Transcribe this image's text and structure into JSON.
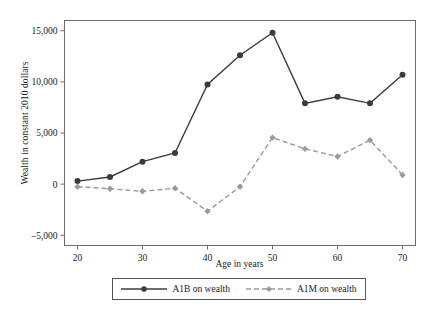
{
  "chart_data": {
    "type": "line",
    "title": "",
    "xlabel": "Age in years",
    "ylabel": "Wealth in constant 2010 dollars",
    "x": [
      20,
      25,
      30,
      35,
      40,
      45,
      50,
      55,
      60,
      65,
      70
    ],
    "xlim": [
      18,
      72
    ],
    "ylim": [
      -6000,
      16000
    ],
    "xticks": [
      20,
      30,
      40,
      50,
      60,
      70
    ],
    "xtick_labels": [
      "20",
      "30",
      "40",
      "50",
      "60",
      "70"
    ],
    "yticks": [
      -5000,
      0,
      5000,
      10000,
      15000
    ],
    "ytick_labels": [
      "–5,000",
      "0",
      "5,000",
      "10,000",
      "15,000"
    ],
    "grid": false,
    "legend_position": "bottom",
    "series": [
      {
        "name": "A1B on wealth",
        "style": "solid",
        "color": "#3b3b3f",
        "marker": "circle",
        "values": [
          300,
          700,
          2200,
          3050,
          9750,
          12600,
          14800,
          7900,
          8550,
          7900,
          10700
        ]
      },
      {
        "name": "A1M on wealth",
        "style": "dashed",
        "color": "#9a9a9c",
        "marker": "diamond",
        "values": [
          -250,
          -450,
          -700,
          -400,
          -2650,
          -250,
          4550,
          3450,
          2700,
          4300,
          900
        ]
      }
    ]
  },
  "legend": {
    "items": [
      {
        "label": "A1B on wealth"
      },
      {
        "label": "A1M on wealth"
      }
    ]
  },
  "axes": {
    "frame_color": "#6b6c70"
  }
}
